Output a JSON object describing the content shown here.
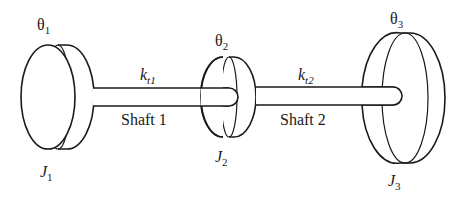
{
  "diagram": {
    "colors": {
      "stroke": "#1a1a1a",
      "background": "#ffffff"
    },
    "disks": [
      {
        "id": "disk-1",
        "angle_label": "θ",
        "angle_sub": "1",
        "inertia_label": "J",
        "inertia_sub": "1"
      },
      {
        "id": "disk-2",
        "angle_label": "θ",
        "angle_sub": "2",
        "inertia_label": "J",
        "inertia_sub": "2"
      },
      {
        "id": "disk-3",
        "angle_label": "θ",
        "angle_sub": "3",
        "inertia_label": "J",
        "inertia_sub": "3"
      }
    ],
    "shafts": [
      {
        "id": "shaft-1",
        "name": "Shaft 1",
        "stiffness_label": "k",
        "stiffness_sub": "t1"
      },
      {
        "id": "shaft-2",
        "name": "Shaft 2",
        "stiffness_label": "k",
        "stiffness_sub": "t2"
      }
    ]
  }
}
